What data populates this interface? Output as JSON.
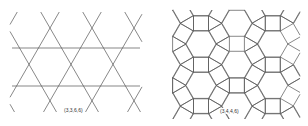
{
  "figure": {
    "panels": [
      {
        "id": "trihexagonal",
        "label": "(3,3,6,6)",
        "tiling": "triangle-hexagon line arrangement",
        "line_color": "#555555",
        "crossing_rows_y": [
          28,
          67,
          105
        ],
        "crossing_spacing_x": 42,
        "horizontal_lines_y": [
          48,
          86
        ],
        "horizontal_line_x_range": [
          12,
          140
        ],
        "clip": [
          10,
          12,
          142,
          112
        ]
      },
      {
        "id": "rhombitrihexagonal",
        "label": "(3,4,4,6)",
        "tiling": "hexagon-square-triangle tiling",
        "line_color": "#555555",
        "edge_length": 15,
        "hexagon_origin": [
          201,
          44
        ],
        "lattice_a": [
          35.9,
          20.7
        ],
        "lattice_b": [
          0,
          41.4
        ],
        "clip": [
          172,
          10,
          300,
          119
        ]
      }
    ]
  }
}
